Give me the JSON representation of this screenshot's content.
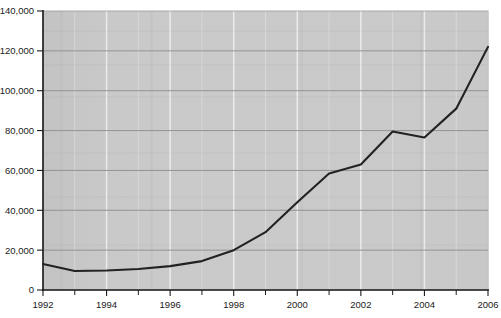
{
  "chart_data": {
    "type": "line",
    "title": "",
    "subtitle": "",
    "xlabel": "",
    "ylabel": "",
    "x": [
      1992,
      1993,
      1994,
      1995,
      1996,
      1997,
      1998,
      1999,
      2000,
      2001,
      2002,
      2003,
      2004,
      2005,
      2006
    ],
    "values": [
      13000,
      9500,
      9800,
      10500,
      12000,
      14500,
      20000,
      29000,
      44000,
      58500,
      63000,
      79500,
      76500,
      91000,
      122000
    ],
    "series": [
      {
        "name": "",
        "values": [
          13000,
          9500,
          9800,
          10500,
          12000,
          14500,
          20000,
          29000,
          44000,
          58500,
          63000,
          79500,
          76500,
          91000,
          122000
        ]
      }
    ],
    "xlim": [
      1992,
      2006
    ],
    "ylim": [
      0,
      140000
    ],
    "ytick_values": [
      0,
      20000,
      40000,
      60000,
      80000,
      100000,
      120000,
      140000
    ],
    "ytick_labels": [
      "0",
      "20,000",
      "40,000",
      "60,000",
      "80,000",
      "100,000",
      "120,000",
      "140,000"
    ],
    "xtick_values": [
      1992,
      1994,
      1996,
      1998,
      2000,
      2002,
      2004,
      2006
    ],
    "xtick_labels": [
      "1992",
      "1994",
      "1996",
      "1998",
      "2000",
      "2002",
      "2004",
      "2006"
    ],
    "xtick_minor_values": [
      1993,
      1995,
      1997,
      1999,
      2001,
      2003,
      2005
    ],
    "grid": "horizontal-and-vertical",
    "legend": "none",
    "line_color": "#222222",
    "plot_background_color": "#cccccc",
    "gridline_color_horizontal": "#8d8d8d",
    "gridline_color_vertical": "#f2f2f2",
    "axis_color": "#1c1c1c",
    "annotations": []
  }
}
